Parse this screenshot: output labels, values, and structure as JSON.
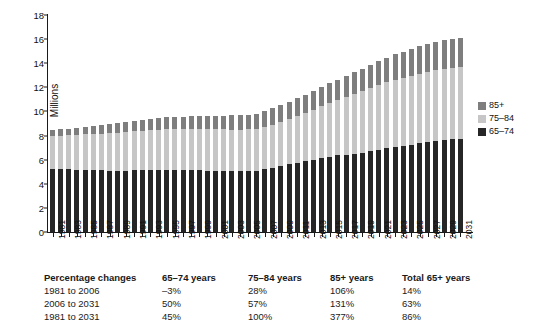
{
  "chart_data": {
    "type": "bar",
    "subtype": "stacked-bar",
    "title": "",
    "xlabel": "",
    "ylabel": "Millions",
    "ylim": [
      0,
      18
    ],
    "ytick_step": 2,
    "yticks": [
      0,
      2,
      4,
      6,
      8,
      10,
      12,
      14,
      16,
      18
    ],
    "grid": false,
    "legend_position": "right",
    "x": [
      1981,
      1982,
      1983,
      1984,
      1985,
      1986,
      1987,
      1988,
      1989,
      1990,
      1991,
      1992,
      1993,
      1994,
      1995,
      1996,
      1997,
      1998,
      1999,
      2000,
      2001,
      2002,
      2003,
      2004,
      2005,
      2006,
      2007,
      2008,
      2009,
      2010,
      2011,
      2012,
      2013,
      2014,
      2015,
      2016,
      2017,
      2018,
      2019,
      2020,
      2021,
      2022,
      2023,
      2024,
      2025,
      2026,
      2027,
      2028,
      2029,
      2030,
      2031
    ],
    "xtick_labels": [
      "1981",
      "1983",
      "1985",
      "1987",
      "1989",
      "1991",
      "1993",
      "1995",
      "1997",
      "1999",
      "2001",
      "2003",
      "2005",
      "2007",
      "2009",
      "2011",
      "2013",
      "2015",
      "2017",
      "2019",
      "2021",
      "2023",
      "2025",
      "2027",
      "2029",
      "2031"
    ],
    "series": [
      {
        "name": "65–74",
        "color": "#262626",
        "values": [
          5.25,
          5.22,
          5.2,
          5.18,
          5.15,
          5.13,
          5.12,
          5.1,
          5.1,
          5.1,
          5.12,
          5.14,
          5.15,
          5.16,
          5.17,
          5.17,
          5.16,
          5.14,
          5.12,
          5.1,
          5.08,
          5.06,
          5.05,
          5.05,
          5.06,
          5.1,
          5.2,
          5.35,
          5.5,
          5.62,
          5.75,
          5.88,
          6.0,
          6.12,
          6.25,
          6.35,
          6.42,
          6.5,
          6.58,
          6.68,
          6.8,
          6.95,
          7.05,
          7.15,
          7.25,
          7.35,
          7.45,
          7.55,
          7.62,
          7.68,
          7.72
        ]
      },
      {
        "name": "75–84",
        "color": "#c6c6c6",
        "values": [
          2.7,
          2.76,
          2.82,
          2.88,
          2.94,
          3.0,
          3.05,
          3.1,
          3.14,
          3.18,
          3.22,
          3.26,
          3.29,
          3.32,
          3.34,
          3.36,
          3.38,
          3.4,
          3.42,
          3.43,
          3.44,
          3.45,
          3.45,
          3.45,
          3.45,
          3.46,
          3.5,
          3.56,
          3.64,
          3.74,
          3.86,
          4.0,
          4.16,
          4.32,
          4.48,
          4.62,
          4.78,
          4.95,
          5.1,
          5.25,
          5.38,
          5.48,
          5.58,
          5.66,
          5.72,
          5.78,
          5.82,
          5.86,
          5.9,
          5.92,
          5.94
        ]
      },
      {
        "name": "85+",
        "color": "#7e7e7e",
        "values": [
          0.5,
          0.53,
          0.56,
          0.6,
          0.64,
          0.68,
          0.72,
          0.76,
          0.8,
          0.84,
          0.88,
          0.92,
          0.95,
          0.98,
          1.0,
          1.02,
          1.04,
          1.06,
          1.08,
          1.1,
          1.12,
          1.15,
          1.18,
          1.2,
          1.22,
          1.26,
          1.3,
          1.35,
          1.4,
          1.44,
          1.48,
          1.52,
          1.56,
          1.6,
          1.64,
          1.68,
          1.74,
          1.8,
          1.86,
          1.92,
          1.98,
          2.04,
          2.1,
          2.16,
          2.22,
          2.28,
          2.34,
          2.38,
          2.42,
          2.44,
          2.46
        ]
      }
    ],
    "legend": [
      {
        "label": "85+",
        "color": "#7e7e7e"
      },
      {
        "label": "75–84",
        "color": "#c6c6c6"
      },
      {
        "label": "65–74",
        "color": "#262626"
      }
    ]
  },
  "table": {
    "headers": [
      "Percentage changes",
      "65–74 years",
      "75–84 years",
      "85+ years",
      "Total 65+ years"
    ],
    "rows": [
      {
        "label": "1981 to 2006",
        "a": "–3%",
        "b": "28%",
        "c": "106%",
        "d": "14%"
      },
      {
        "label": "2006 to 2031",
        "a": "50%",
        "b": "57%",
        "c": "131%",
        "d": "63%"
      },
      {
        "label": "1981 to 2031",
        "a": "45%",
        "b": "100%",
        "c": "377%",
        "d": "86%"
      }
    ]
  }
}
